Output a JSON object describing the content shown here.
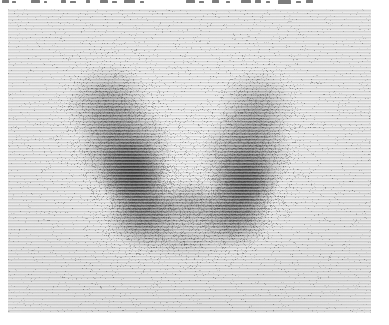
{
  "figure": {
    "name": "thyroid-scintigram",
    "modality": "rectilinear radionuclide scan",
    "orientation": "anterior",
    "caption_visible": false
  },
  "annotation_strip": {
    "legible": false,
    "note": "row of handwritten/printed annotation characters clipped by the top crop edge; only ink stubs remain",
    "fragments": [
      {
        "x": 2,
        "y": 0,
        "w": 7,
        "h": 3
      },
      {
        "x": 12,
        "y": 1,
        "w": 4,
        "h": 2
      },
      {
        "x": 31,
        "y": 0,
        "w": 9,
        "h": 3
      },
      {
        "x": 44,
        "y": 1,
        "w": 3,
        "h": 2
      },
      {
        "x": 61,
        "y": 0,
        "w": 5,
        "h": 3
      },
      {
        "x": 70,
        "y": 1,
        "w": 6,
        "h": 2
      },
      {
        "x": 86,
        "y": 0,
        "w": 4,
        "h": 3
      },
      {
        "x": 100,
        "y": 0,
        "w": 8,
        "h": 3
      },
      {
        "x": 112,
        "y": 1,
        "w": 5,
        "h": 2
      },
      {
        "x": 124,
        "y": 0,
        "w": 11,
        "h": 3
      },
      {
        "x": 140,
        "y": 1,
        "w": 4,
        "h": 2
      },
      {
        "x": 186,
        "y": 0,
        "w": 9,
        "h": 3
      },
      {
        "x": 199,
        "y": 1,
        "w": 5,
        "h": 2
      },
      {
        "x": 212,
        "y": 0,
        "w": 7,
        "h": 3
      },
      {
        "x": 226,
        "y": 1,
        "w": 4,
        "h": 2
      },
      {
        "x": 241,
        "y": 0,
        "w": 10,
        "h": 3
      },
      {
        "x": 255,
        "y": 0,
        "w": 6,
        "h": 3
      },
      {
        "x": 266,
        "y": 1,
        "w": 4,
        "h": 2
      },
      {
        "x": 278,
        "y": 0,
        "w": 13,
        "h": 4
      },
      {
        "x": 296,
        "y": 1,
        "w": 5,
        "h": 2
      },
      {
        "x": 306,
        "y": 0,
        "w": 7,
        "h": 3
      }
    ]
  },
  "panel": {
    "x": 8,
    "y": 9,
    "width": 363,
    "height": 304,
    "background_color": "#d8d8d8",
    "border": "none"
  },
  "chart_data": {
    "type": "heatmap",
    "title": "",
    "xlabel": "",
    "ylabel": "",
    "grid": false,
    "legend": null,
    "colormap": "grayscale-inverted",
    "field": {
      "x": 0,
      "y": 0,
      "width": 363,
      "height": 304
    },
    "regions": [
      {
        "name": "left-lobe-upper-pole",
        "cx": 100,
        "cy": 95,
        "rx": 42,
        "ry": 40,
        "intensity": 0.34,
        "rotate": -26
      },
      {
        "name": "left-lobe-body",
        "cx": 117,
        "cy": 140,
        "rx": 47,
        "ry": 52,
        "intensity": 0.52,
        "rotate": -22
      },
      {
        "name": "left-lobe-hotspot",
        "cx": 126,
        "cy": 168,
        "rx": 34,
        "ry": 40,
        "intensity": 0.72,
        "rotate": -18
      },
      {
        "name": "left-lobe-lower-pole",
        "cx": 135,
        "cy": 205,
        "rx": 38,
        "ry": 34,
        "intensity": 0.5,
        "rotate": -10
      },
      {
        "name": "right-lobe-upper-pole",
        "cx": 248,
        "cy": 100,
        "rx": 38,
        "ry": 40,
        "intensity": 0.3,
        "rotate": 26
      },
      {
        "name": "right-lobe-body",
        "cx": 238,
        "cy": 145,
        "rx": 45,
        "ry": 50,
        "intensity": 0.46,
        "rotate": 20
      },
      {
        "name": "right-lobe-hotspot",
        "cx": 236,
        "cy": 176,
        "rx": 34,
        "ry": 38,
        "intensity": 0.62,
        "rotate": 14
      },
      {
        "name": "right-lobe-lower-pole",
        "cx": 226,
        "cy": 208,
        "rx": 36,
        "ry": 32,
        "intensity": 0.44,
        "rotate": 8
      },
      {
        "name": "isthmus",
        "cx": 182,
        "cy": 196,
        "rx": 48,
        "ry": 26,
        "intensity": 0.3,
        "rotate": 0
      },
      {
        "name": "inferior-spill",
        "cx": 176,
        "cy": 228,
        "rx": 58,
        "ry": 24,
        "intensity": 0.17,
        "rotate": 0
      },
      {
        "name": "cold-midline-notch",
        "cx": 180,
        "cy": 120,
        "rx": 40,
        "ry": 46,
        "intensity": 0.0,
        "rotate": 0
      }
    ],
    "background_counts": "low uniform scatter across field",
    "texture": "horizontal rectilinear scan lines, ~3 px pitch"
  }
}
